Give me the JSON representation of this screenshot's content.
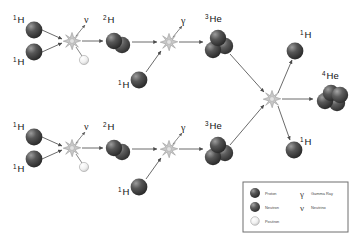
{
  "diagram": {
    "background_color": "#ffffff",
    "width": 357,
    "height": 237
  },
  "colors": {
    "proton": "#3a3a3a",
    "proton_highlight": "#8e8e8e",
    "neutron": "#4a4a4a",
    "neutron_highlight": "#9a9a9a",
    "positron": "#f2f2f2",
    "positron_stroke": "#9a9a9a",
    "arrow": "#5a5a5a",
    "burst": "#c0c0c0",
    "burst_stroke": "#8a8a8a",
    "legend_border": "#6f6f6f",
    "text": "#111111"
  },
  "labels": {
    "hydrogen_1": {
      "mass": "1",
      "symbol": "H"
    },
    "hydrogen_2": {
      "mass": "2",
      "symbol": "H"
    },
    "helium_3": {
      "mass": "3",
      "symbol": "He"
    },
    "helium_4": {
      "mass": "4",
      "symbol": "He"
    },
    "gamma": "γ",
    "neutrino": "ν"
  },
  "branches": {
    "top": {
      "name": "top-branch",
      "inputs": [
        {
          "id": "top-h1-a",
          "label_mass": "1",
          "label_symbol": "H"
        },
        {
          "id": "top-h1-b",
          "label_mass": "1",
          "label_symbol": "H"
        }
      ],
      "fusion_1_products": {
        "deuterium": {
          "label_mass": "2",
          "label_symbol": "H"
        },
        "neutrino": "ν",
        "positron": "positron"
      },
      "fusion_2_input": {
        "label_mass": "1",
        "label_symbol": "H"
      },
      "fusion_2_products": {
        "helium3": {
          "label_mass": "3",
          "label_symbol": "He"
        },
        "gamma": "γ"
      }
    },
    "bottom": {
      "name": "bottom-branch",
      "inputs": [
        {
          "id": "bot-h1-a",
          "label_mass": "1",
          "label_symbol": "H"
        },
        {
          "id": "bot-h1-b",
          "label_mass": "1",
          "label_symbol": "H"
        }
      ],
      "fusion_1_products": {
        "deuterium": {
          "label_mass": "2",
          "label_symbol": "H"
        },
        "neutrino": "ν",
        "positron": "positron"
      },
      "fusion_2_input": {
        "label_mass": "1",
        "label_symbol": "H"
      },
      "fusion_2_products": {
        "helium3": {
          "label_mass": "3",
          "label_symbol": "He"
        },
        "gamma": "γ"
      }
    },
    "final": {
      "name": "final-fusion",
      "products": [
        {
          "id": "final-h1-top",
          "label_mass": "1",
          "label_symbol": "H"
        },
        {
          "id": "final-he4",
          "label_mass": "4",
          "label_symbol": "He"
        },
        {
          "id": "final-h1-bottom",
          "label_mass": "1",
          "label_symbol": "H"
        }
      ]
    }
  },
  "legend": {
    "items_left": [
      {
        "icon": "proton-sphere",
        "label": "Proton"
      },
      {
        "icon": "neutron-sphere",
        "label": "Neutron"
      },
      {
        "icon": "positron-sphere",
        "label": "Positron"
      }
    ],
    "items_right": [
      {
        "glyph": "γ",
        "label": "Gamma Ray"
      },
      {
        "glyph": "ν",
        "label": "Neutrino"
      }
    ]
  }
}
